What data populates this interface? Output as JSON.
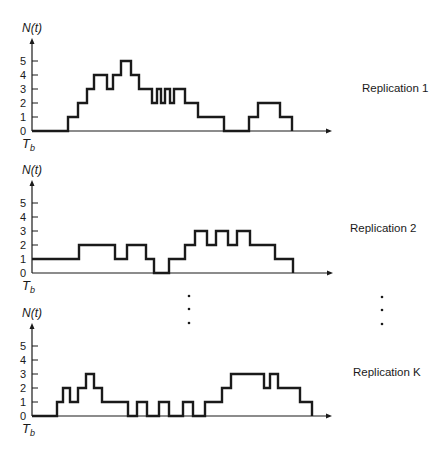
{
  "figure": {
    "y_axis_label": "N(t)",
    "x_origin_label": "T",
    "x_origin_subscript": "b",
    "tick_labels": [
      "0",
      "1",
      "2",
      "3",
      "4",
      "5"
    ],
    "ellipsis": "⋮"
  },
  "panels": [
    {
      "label": "Replication 1",
      "axis_x": 32,
      "baseline_y": 131,
      "unit_px": 14,
      "axis_top": 38,
      "axis_end": 332,
      "label_pos": [
        362,
        92
      ],
      "path": "M32,131 L68,131 L68,117 L78,117 L78,103 L87,103 L87,89 L94,89 L94,75 L107,75 L107,89 L113,89 L113,75 L121,75 L121,61 L131,61 L131,75 L139,75 L139,89 L152,89 L152,103 L157,103 L157,89 L161,89 L161,103 L165,103 L165,89 L170,89 L170,103 L174,103 L174,89 L185,89 L185,103 L198,103 L198,117 L224,117 L224,131 L249,131 L249,117 L258,117 L258,103 L280,103 L280,117 L292,117 L292,131"
    },
    {
      "label": "Replication 2",
      "axis_x": 32,
      "baseline_y": 273,
      "unit_px": 14,
      "axis_top": 180,
      "axis_end": 333,
      "label_pos": [
        350,
        232
      ],
      "path": "M32,259 L79,259 L79,245 L115,245 L115,259 L127,259 L127,245 L146,245 L146,259 L154,259 L154,273 L169,273 L169,259 L185,259 L185,245 L195,245 L195,231 L207,231 L207,245 L216,245 L216,231 L228,231 L228,245 L237,245 L237,231 L250,231 L250,245 L275,245 L275,259 L293,259 L293,273"
    },
    {
      "label": "Replication K",
      "axis_x": 32,
      "baseline_y": 416,
      "unit_px": 14,
      "axis_top": 323,
      "axis_end": 332,
      "label_pos": [
        353,
        376
      ],
      "path": "M32,416 L57,416 L57,402 L63,402 L63,388 L70,388 L70,402 L78,402 L78,388 L86,388 L86,374 L94,374 L94,388 L102,388 L102,402 L128,402 L128,416 L137,416 L137,402 L147,402 L147,416 L159,416 L159,402 L169,402 L169,416 L183,416 L183,402 L193,402 L193,416 L205,416 L205,402 L222,402 L222,388 L231,388 L231,374 L264,374 L264,388 L270,388 L270,374 L278,374 L278,388 L300,388 L300,402 L312,402 L312,416"
    }
  ],
  "ellipsis_columns": [
    {
      "x": 189,
      "y": [
        296,
        309,
        323
      ]
    },
    {
      "x": 382,
      "y": [
        297,
        310,
        324
      ]
    }
  ],
  "chart_data": {
    "type": "line",
    "title": "",
    "xlabel": "t (origin T_b)",
    "ylabel": "N(t)",
    "ylim": [
      0,
      5
    ],
    "y_ticks": [
      0,
      1,
      2,
      3,
      4,
      5
    ],
    "step": true,
    "series": [
      {
        "name": "Replication 1",
        "steps_x_px": [
          32,
          68,
          78,
          87,
          94,
          107,
          113,
          121,
          131,
          139,
          152,
          157,
          161,
          165,
          170,
          174,
          185,
          198,
          224,
          249,
          258,
          280,
          292
        ],
        "values": [
          0,
          1,
          2,
          3,
          4,
          3,
          4,
          5,
          4,
          3,
          2,
          3,
          2,
          3,
          2,
          3,
          2,
          1,
          0,
          1,
          2,
          1,
          0
        ]
      },
      {
        "name": "Replication 2",
        "steps_x_px": [
          32,
          79,
          115,
          127,
          146,
          154,
          169,
          185,
          195,
          207,
          216,
          228,
          237,
          250,
          275,
          293
        ],
        "values": [
          1,
          2,
          1,
          2,
          1,
          0,
          1,
          2,
          3,
          2,
          3,
          2,
          3,
          2,
          1,
          0
        ]
      },
      {
        "name": "Replication K",
        "steps_x_px": [
          32,
          57,
          63,
          70,
          78,
          86,
          94,
          102,
          128,
          137,
          147,
          159,
          169,
          183,
          193,
          205,
          222,
          231,
          264,
          270,
          278,
          300,
          312
        ],
        "values": [
          0,
          1,
          2,
          1,
          2,
          3,
          2,
          1,
          0,
          1,
          0,
          1,
          0,
          1,
          0,
          1,
          2,
          3,
          2,
          3,
          2,
          1,
          0
        ]
      }
    ],
    "annotations": [
      "vertical ellipsis between Replication 2 and Replication K"
    ]
  }
}
